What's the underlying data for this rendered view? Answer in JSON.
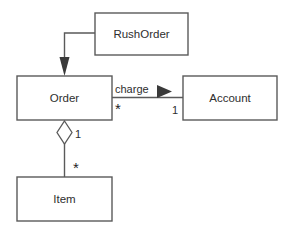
{
  "diagram": {
    "kind": "uml-class-diagram",
    "background_color": "#ffffff",
    "line_color": "#5a5a5a",
    "text_color": "#2e2e2e",
    "fill_color": "#ffffff",
    "classes": [
      {
        "id": "rushorder",
        "name": "RushOrder",
        "x": 95,
        "y": 13,
        "w": 93,
        "h": 42
      },
      {
        "id": "order",
        "name": "Order",
        "x": 17,
        "y": 76,
        "w": 95,
        "h": 44
      },
      {
        "id": "account",
        "name": "Account",
        "x": 183,
        "y": 76,
        "w": 94,
        "h": 44
      },
      {
        "id": "item",
        "name": "Item",
        "x": 17,
        "y": 177,
        "w": 95,
        "h": 44
      }
    ],
    "relationships": [
      {
        "id": "rushorder-to-order",
        "type": "generalization-arrow",
        "from": "rushorder",
        "to": "order",
        "arrowhead": "solid-filled",
        "label": ""
      },
      {
        "id": "order-charge-account",
        "type": "association",
        "from": "order",
        "to": "account",
        "label": "charge",
        "direction_marker": "solid-triangle-right",
        "source_multiplicity": "*",
        "target_multiplicity": "1"
      },
      {
        "id": "order-aggregates-item",
        "type": "aggregation",
        "from": "order",
        "to": "item",
        "diamond": "hollow",
        "source_multiplicity": "1",
        "target_multiplicity": "*",
        "label": ""
      }
    ],
    "labels": {
      "charge": "charge",
      "mult_order_end": "*",
      "mult_account_end": "1",
      "mult_aggregation_whole": "1",
      "mult_aggregation_part": "*"
    }
  }
}
